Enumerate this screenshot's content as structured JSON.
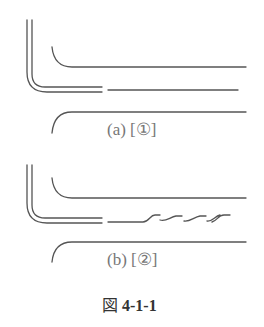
{
  "figure": {
    "caption_prefix": "図",
    "caption_number": "4-1-1",
    "line_color": "#555555",
    "panels": [
      {
        "id": "a",
        "label": "(a) [①]",
        "middle_line_style": "straight"
      },
      {
        "id": "b",
        "label": "(b) [②]",
        "middle_line_style": "wavy"
      }
    ]
  }
}
